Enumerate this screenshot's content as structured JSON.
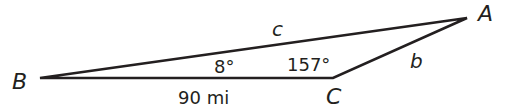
{
  "diagram": {
    "type": "triangle",
    "vertices": {
      "A": {
        "label": "A",
        "x": 467,
        "y": 18
      },
      "B": {
        "label": "B",
        "x": 40,
        "y": 78
      },
      "C": {
        "label": "C",
        "x": 333,
        "y": 78
      }
    },
    "sides": {
      "c": {
        "label": "c",
        "from": "B",
        "to": "A"
      },
      "b": {
        "label": "b",
        "from": "C",
        "to": "A"
      },
      "a": {
        "label": "90 mi",
        "from": "B",
        "to": "C"
      }
    },
    "angles": {
      "B": {
        "label": "8°"
      },
      "C": {
        "label": "157°"
      }
    },
    "colors": {
      "stroke": "#231f20",
      "background": "#ffffff"
    }
  }
}
